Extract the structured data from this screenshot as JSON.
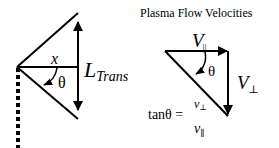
{
  "left_diagram": {
    "x_label": "x",
    "theta_label": "θ",
    "length_label_main": "L",
    "length_label_sub": "Trans"
  },
  "right_diagram": {
    "title": "Plasma Flow Velocities",
    "v_par_main": "V",
    "v_par_sub": "||",
    "v_perp_main": "V",
    "v_perp_sub": "⊥",
    "theta_label": "θ",
    "formula": {
      "lhs": "tanθ =",
      "numerator_main": "v",
      "numerator_sub": "⊥",
      "denominator_main": "v",
      "denominator_sub": "∥"
    }
  },
  "colors": {
    "stroke": "#000000",
    "background": "#ffffff"
  }
}
